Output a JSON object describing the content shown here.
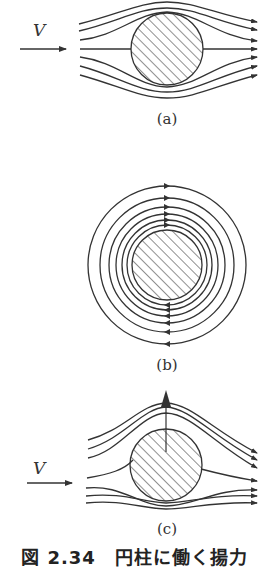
{
  "figure": {
    "caption": "図 2.34　円柱に働く揚力",
    "panels": [
      {
        "id": "a",
        "label": "(a)",
        "description": "uniform flow around a cylinder",
        "velocity_label": "V"
      },
      {
        "id": "b",
        "label": "(b)",
        "description": "circulation around a cylinder"
      },
      {
        "id": "c",
        "label": "(c)",
        "description": "uniform flow plus circulation producing lift",
        "velocity_label": "V"
      }
    ],
    "colors": {
      "stroke": "#333333",
      "background": "#ffffff"
    }
  }
}
